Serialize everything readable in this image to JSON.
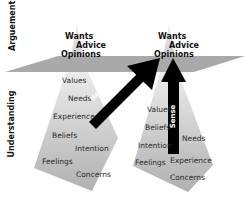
{
  "side_labels": {
    "top": "Arguement",
    "bottom": "Understanding"
  },
  "colors": {
    "plane": "#a9a9a9",
    "cone_light": "#dcdcdc",
    "cone_dark": "#b5b5b5",
    "arrow": "#000000",
    "text": "#2a2a2a"
  },
  "left_stack": {
    "top_labels": [
      "Wants",
      "Advice",
      "Opinions"
    ],
    "bottom_labels": [
      "Values",
      "Needs",
      "Experience",
      "Beliefs",
      "Intention",
      "Feelings",
      "Concerns"
    ]
  },
  "right_stack": {
    "top_labels": [
      "Wants",
      "Advice",
      "Opinions"
    ],
    "bottom_labels": [
      "Values",
      "Beliefs",
      "Intention",
      "Feelings",
      "Needs",
      "Experience",
      "Concerns"
    ]
  },
  "arrows": {
    "diagonal": "Nonsense",
    "vertical": "Sense"
  }
}
